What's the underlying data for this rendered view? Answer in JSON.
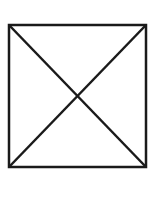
{
  "diagram": {
    "shape": "square-with-diagonals",
    "stroke_color": "#1a1a1a",
    "background": "#ffffff",
    "square": {
      "x": 9,
      "y": 25,
      "width": 137,
      "height": 142
    },
    "stroke_width": 2.5
  }
}
